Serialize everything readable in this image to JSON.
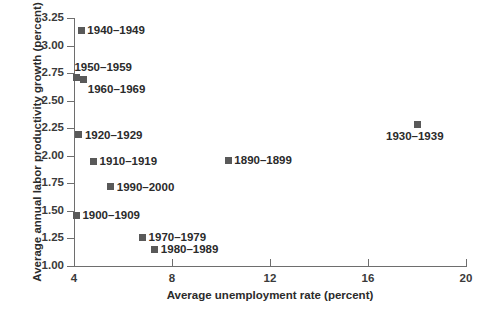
{
  "chart_data": {
    "type": "scatter",
    "title": "",
    "xlabel": "Average unemployment rate (percent)",
    "ylabel": "Average annual labor productivity growth (percent)",
    "xlim": [
      4,
      20
    ],
    "ylim": [
      1.0,
      3.25
    ],
    "xticks": [
      "4",
      "8",
      "12",
      "16",
      "20"
    ],
    "xtick_values": [
      4,
      8,
      12,
      16,
      20
    ],
    "yticks": [
      "1.00",
      "1.25",
      "1.50",
      "1.75",
      "2.00",
      "2.25",
      "2.50",
      "2.75",
      "3.00",
      "3.25"
    ],
    "ytick_values": [
      1.0,
      1.25,
      1.5,
      1.75,
      2.0,
      2.25,
      2.5,
      2.75,
      3.0,
      3.25
    ],
    "grid": false,
    "legend": "none",
    "marker_color": "#595959",
    "axis_color": "#6e6e6e",
    "points": [
      {
        "label": "1940–1949",
        "x": 4.3,
        "y": 3.14,
        "label_pos": "right"
      },
      {
        "label": "1950–1959",
        "x": 4.1,
        "y": 2.71,
        "label_pos": "above-right"
      },
      {
        "label": "1960–1969",
        "x": 4.4,
        "y": 2.69,
        "label_pos": "below-right"
      },
      {
        "label": "1920–1929",
        "x": 4.2,
        "y": 2.19,
        "label_pos": "right"
      },
      {
        "label": "1910–1919",
        "x": 4.8,
        "y": 1.95,
        "label_pos": "right"
      },
      {
        "label": "1990–2000",
        "x": 5.5,
        "y": 1.72,
        "label_pos": "right"
      },
      {
        "label": "1900–1909",
        "x": 4.1,
        "y": 1.46,
        "label_pos": "right"
      },
      {
        "label": "1970–1979",
        "x": 6.8,
        "y": 1.26,
        "label_pos": "right"
      },
      {
        "label": "1980–1989",
        "x": 7.3,
        "y": 1.15,
        "label_pos": "right"
      },
      {
        "label": "1890–1899",
        "x": 10.3,
        "y": 1.96,
        "label_pos": "right"
      },
      {
        "label": "1930–1939",
        "x": 18.0,
        "y": 2.28,
        "label_pos": "below"
      }
    ]
  }
}
